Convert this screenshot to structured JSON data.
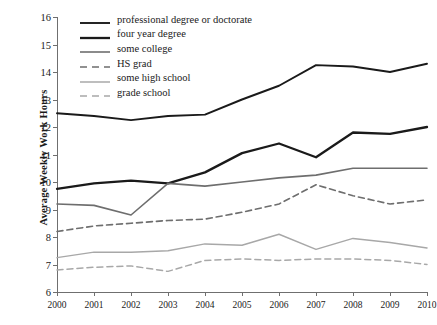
{
  "chart_data": {
    "type": "line",
    "title": "",
    "xlabel": "",
    "ylabel": "Average Weekly Work Hours",
    "x": [
      2000,
      2001,
      2002,
      2003,
      2004,
      2005,
      2006,
      2007,
      2008,
      2009,
      2010
    ],
    "xticklabels": [
      "2000",
      "2001",
      "2002",
      "2003",
      "2004",
      "2005",
      "2006",
      "2007",
      "2008",
      "2009",
      "2010"
    ],
    "yticklabels": [
      "6",
      "7",
      "8",
      "9",
      "10",
      "11",
      "12",
      "13",
      "14",
      "15",
      "16"
    ],
    "ylim": [
      6,
      16
    ],
    "xlim": [
      2000,
      2010
    ],
    "grid": false,
    "legend_position": "top-left",
    "series": [
      {
        "name": "professional degree or doctorate",
        "color": "#1a1a1a",
        "style": "solid",
        "width": 1.9,
        "values": [
          12.5,
          12.4,
          12.25,
          12.4,
          12.45,
          13.0,
          13.5,
          14.25,
          14.2,
          14.0,
          14.3
        ]
      },
      {
        "name": "four year degree",
        "color": "#1a1a1a",
        "style": "solid",
        "width": 2.3,
        "values": [
          9.75,
          9.95,
          10.05,
          9.95,
          10.35,
          11.05,
          11.4,
          10.9,
          11.8,
          11.75,
          12.0
        ]
      },
      {
        "name": "some college",
        "color": "#6e6e6e",
        "style": "solid",
        "width": 1.6,
        "values": [
          9.2,
          9.15,
          8.8,
          9.95,
          9.85,
          10.0,
          10.15,
          10.25,
          10.5,
          10.5,
          10.5
        ]
      },
      {
        "name": "HS grad",
        "color": "#6e6e6e",
        "style": "dashed",
        "width": 1.6,
        "values": [
          8.2,
          8.4,
          8.5,
          8.6,
          8.65,
          8.9,
          9.2,
          9.9,
          9.5,
          9.2,
          9.35
        ]
      },
      {
        "name": "some high school",
        "color": "#a8a8a8",
        "style": "solid",
        "width": 1.5,
        "values": [
          7.25,
          7.45,
          7.45,
          7.5,
          7.75,
          7.7,
          8.1,
          7.55,
          7.95,
          7.8,
          7.6
        ]
      },
      {
        "name": "grade school",
        "color": "#a8a8a8",
        "style": "dashed",
        "width": 1.5,
        "values": [
          6.8,
          6.9,
          6.95,
          6.75,
          7.15,
          7.2,
          7.15,
          7.2,
          7.2,
          7.15,
          7.0
        ]
      }
    ]
  }
}
